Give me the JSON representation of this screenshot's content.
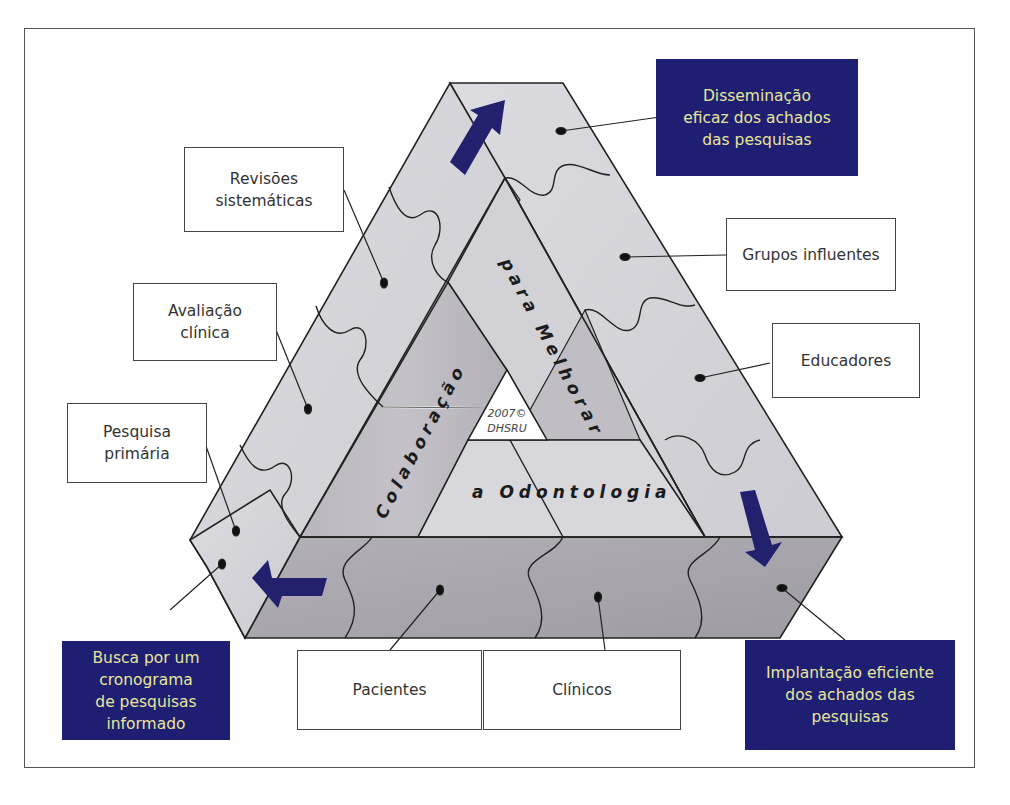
{
  "diagram": {
    "center_text": {
      "left_band": "Colaboração",
      "right_band": "para Melhorar",
      "bottom_band": "a Odontologia",
      "copyright_line1": "2007©",
      "copyright_line2": "DHSRU"
    },
    "label_boxes": [
      {
        "id": "revisoes",
        "text": "Revisões\nsistemáticas"
      },
      {
        "id": "avaliacao",
        "text": "Avaliação\nclínica"
      },
      {
        "id": "pesquisa",
        "text": "Pesquisa\nprimária"
      },
      {
        "id": "grupos",
        "text": "Grupos influentes"
      },
      {
        "id": "educadores",
        "text": "Educadores"
      },
      {
        "id": "pacientes",
        "text": "Pacientes"
      },
      {
        "id": "clinicos",
        "text": "Clínicos"
      }
    ],
    "highlight_boxes": [
      {
        "id": "disseminacao",
        "text": "Disseminação\neficaz dos achados\ndas pesquisas"
      },
      {
        "id": "busca",
        "text": "Busca por um\ncronograma\nde pesquisas\ninformado"
      },
      {
        "id": "implantacao",
        "text": "Implantação eficiente\ndos achados das\npesquisas"
      }
    ],
    "colors": {
      "highlight_bg": "#1e1f72",
      "highlight_text": "#e8e59a",
      "arrow": "#23206e",
      "face_light": "#d6d5da",
      "face_mid": "#c2c0c6",
      "face_dark": "#a9a6ad",
      "outline": "#222222"
    }
  }
}
